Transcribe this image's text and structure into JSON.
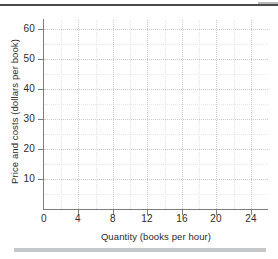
{
  "chart_data": {
    "type": "line",
    "title": "",
    "xlabel": "Quantity (books per hour)",
    "ylabel": "Price and costs (dollars per book)",
    "xlim": [
      0,
      26
    ],
    "ylim": [
      0,
      63
    ],
    "x_ticks": [
      0,
      4,
      8,
      12,
      16,
      20,
      24
    ],
    "x_tick_labels": [
      "0",
      "4",
      "8",
      "12",
      "16",
      "20",
      "24"
    ],
    "y_ticks": [
      10,
      20,
      30,
      40,
      50,
      60
    ],
    "y_tick_labels": [
      "10",
      "20",
      "30",
      "40",
      "50",
      "60"
    ],
    "x_minor_ticks": [
      2,
      6,
      10,
      14,
      18,
      22,
      26
    ],
    "y_minor_ticks": [
      5,
      15,
      25,
      35,
      45,
      55
    ],
    "grid": true,
    "legend": null,
    "series": [],
    "annotations": [],
    "note": "Empty axes grid template with no plotted data series."
  },
  "axis_labels": {
    "y_title": "Price and costs (dollars per book)",
    "x_title": "Quantity (books per hour)"
  },
  "colors": {
    "axis": "#7d7d7d",
    "grid_major": "#c9c9c9",
    "grid_minor": "#e3e3e3",
    "text": "#2b2b2b",
    "top_rule": "#4a4a4a",
    "bottom_rule": "#c6c7c9",
    "background": "#ffffff"
  }
}
